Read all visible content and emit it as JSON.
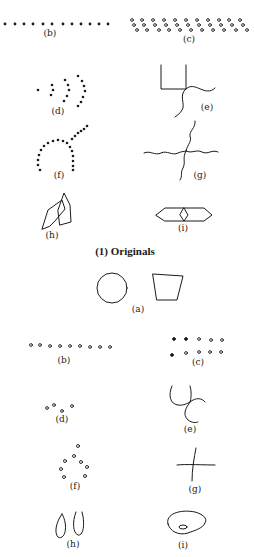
{
  "figure": {
    "ink_color": "#1a1a1a",
    "background": "#ffffff",
    "section_caption": "(1) Originals",
    "originals": {
      "labels": {
        "b": "(b)",
        "c": "(c)",
        "d": "(d)",
        "e": "(e)",
        "f": "(f)",
        "g": "(g)",
        "h": "(h)",
        "i": "(i)"
      },
      "descriptions": {
        "b": "row of 12 filled dots",
        "c": "staggered band of open circles",
        "d": "single dot followed by three nested arcs of filled dots",
        "e": "open square outline with wavy lines leaving the bottom-right corner",
        "f": "arc of filled dots with a dotted line branching up-right",
        "g": "two crossing wavy lines",
        "h": "two overlapping pointed polygons",
        "i": "elongated hexagon with a small diamond in the middle"
      }
    },
    "reproductions": {
      "labels": {
        "a": "(a)",
        "b": "(b)",
        "c": "(c)",
        "d": "(d)",
        "e": "(e)",
        "f": "(f)",
        "g": "(g)",
        "h": "(h)",
        "i": "(i)"
      },
      "descriptions": {
        "a": "circle and trapezoid",
        "b": "row of 9 open circles",
        "c": "two rows of five dots (mix of filled and open)",
        "d": "four small open circles",
        "e": "curved cross of lines",
        "f": "diamond-like ring of open circles",
        "g": "simple plus cross",
        "h": "two teardrop loops",
        "i": "rounded blob with a small oval inside"
      }
    }
  }
}
